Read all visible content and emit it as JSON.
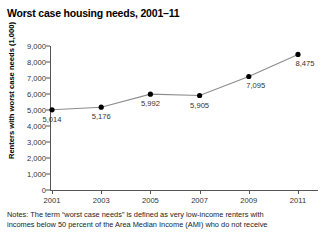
{
  "title": "Worst case housing needs, 2001–11",
  "chart_data": {
    "type": "line",
    "title": "Worst case housing needs, 2001–11",
    "xlabel": "",
    "ylabel": "Renters with worst case needs (1,000)",
    "categories": [
      "2001",
      "2003",
      "2005",
      "2007",
      "2009",
      "2011"
    ],
    "x": [
      2001,
      2003,
      2005,
      2007,
      2009,
      2011
    ],
    "values": [
      5014,
      5176,
      5992,
      5905,
      7095,
      8475
    ],
    "point_labels": [
      "5,014",
      "5,176",
      "5,992",
      "5,905",
      "7,095",
      "8,475"
    ],
    "ylim": [
      0,
      9000
    ],
    "yticks": [
      0,
      1000,
      2000,
      3000,
      4000,
      5000,
      6000,
      7000,
      8000,
      9000
    ],
    "ytick_labels": [
      "0",
      "1,000",
      "2,000",
      "3,000",
      "4,000",
      "5,000",
      "6,000",
      "7,000",
      "8,000",
      "9,000"
    ],
    "xtick_labels": [
      "2001",
      "2003",
      "2005",
      "2007",
      "2009",
      "2011"
    ],
    "grid": false,
    "legend": false,
    "line_color": "#8c8c8c",
    "marker_color": "#000000"
  },
  "notes": {
    "line1": "Notes: The term “worst case needs” is defined as very low-income renters with",
    "line2": "incomes below 50 percent of the Area Median Income (AMI) who do not receive"
  }
}
